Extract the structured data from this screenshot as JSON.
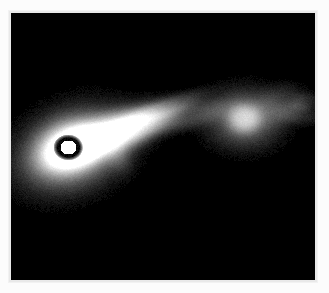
{
  "figure": {
    "domain": "natural-image",
    "caption": "",
    "background_color": "#fcfcfc",
    "plate_color": "#000000",
    "border_color": "#e9e9e9",
    "colormap": "grayscale",
    "frame": {
      "x": 11,
      "y": 13,
      "width": 304,
      "height": 267
    }
  },
  "features": [
    {
      "name": "faint-counter-blob",
      "label": "faint counter-side blob",
      "cx": 108,
      "cy": 145,
      "rx": 11,
      "ry": 14,
      "rotation": -25,
      "peak": 0.13,
      "falloff": 1.25
    },
    {
      "name": "core-outer-halo",
      "label": "core outer halo",
      "cx": 62,
      "cy": 136,
      "rx": 52,
      "ry": 36,
      "rotation": -22,
      "peak": 0.52,
      "falloff": 1.45
    },
    {
      "name": "core-inner-halo",
      "label": "core inner halo",
      "cx": 58,
      "cy": 135,
      "rx": 30,
      "ry": 22,
      "rotation": -22,
      "peak": 0.78,
      "falloff": 1.3
    },
    {
      "name": "jet-lobe-primary",
      "label": "primary jet lobe",
      "cx": 96,
      "cy": 122,
      "rx": 52,
      "ry": 20,
      "rotation": -22,
      "peak": 0.62,
      "falloff": 1.5
    },
    {
      "name": "jet-lobe-extension",
      "label": "jet lobe extension",
      "cx": 122,
      "cy": 113,
      "rx": 44,
      "ry": 15,
      "rotation": -21,
      "peak": 0.42,
      "falloff": 1.5
    },
    {
      "name": "jet-bridge",
      "label": "jet bridge",
      "cx": 176,
      "cy": 103,
      "rx": 42,
      "ry": 12,
      "rotation": -14,
      "peak": 0.2,
      "falloff": 1.6
    },
    {
      "name": "jet-upper-filament",
      "label": "upper jet filament",
      "cx": 150,
      "cy": 96,
      "rx": 44,
      "ry": 9,
      "rotation": -20,
      "peak": 0.22,
      "falloff": 1.6
    },
    {
      "name": "secondary-knot-halo",
      "label": "secondary knot halo",
      "cx": 233,
      "cy": 105,
      "rx": 36,
      "ry": 28,
      "rotation": 0,
      "peak": 0.3,
      "falloff": 1.5
    },
    {
      "name": "secondary-knot",
      "label": "secondary knot",
      "cx": 233,
      "cy": 105,
      "rx": 16,
      "ry": 14,
      "rotation": 0,
      "peak": 0.52,
      "falloff": 1.4
    },
    {
      "name": "outer-wisp-a",
      "label": "outer wisp a",
      "cx": 268,
      "cy": 92,
      "rx": 26,
      "ry": 18,
      "rotation": -18,
      "peak": 0.15,
      "falloff": 1.7
    },
    {
      "name": "outer-wisp-b",
      "label": "outer wisp b",
      "cx": 286,
      "cy": 100,
      "rx": 22,
      "ry": 10,
      "rotation": 8,
      "peak": 0.11,
      "falloff": 1.7
    },
    {
      "name": "outer-wisp-tip",
      "label": "outer wisp tip",
      "cx": 293,
      "cy": 88,
      "rx": 14,
      "ry": 8,
      "rotation": -10,
      "peak": 0.09,
      "falloff": 1.8
    }
  ],
  "core": {
    "name": "saturated-core",
    "label": "saturated core",
    "cx": 57,
    "cy": 134,
    "dark_ring_rx": 15,
    "dark_ring_ry": 13,
    "white_rx": 8,
    "white_ry": 7,
    "white_color": "#ffffff",
    "ring_color": "#000000"
  },
  "noise": {
    "amount": 0.045,
    "grain": 1
  }
}
